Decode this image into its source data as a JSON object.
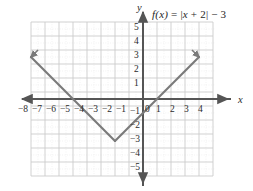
{
  "figure": {
    "width": 253,
    "height": 191,
    "background": "#ffffff"
  },
  "function_label": {
    "full": "f(x) = |x + 2| − 3",
    "fname": "f",
    "fvar": "(x)",
    "equals": " = |",
    "expr_var": "x",
    "expr_rest": " + 2| − 3"
  },
  "axes": {
    "x_label": "x",
    "y_label": "y",
    "origin_label": "0",
    "x_ticks": [
      "−8",
      "−7",
      "−6",
      "−5",
      "−4",
      "−3",
      "−2",
      "−1",
      "1",
      "2",
      "3",
      "4"
    ],
    "y_ticks": [
      "5",
      "4",
      "3",
      "2",
      "1",
      "−1",
      "−2",
      "−3",
      "−4",
      "−5"
    ],
    "x_range": [
      -8.5,
      4.5
    ],
    "y_range": [
      -5.5,
      5.5
    ],
    "axis_color": "#555555",
    "grid_color": "#c9c9c9",
    "minor_grid_color": "#e2e2e2"
  },
  "chart_data": {
    "type": "line",
    "title": "",
    "subtitle": "",
    "xlabel": "x",
    "ylabel": "y",
    "xlim": [
      -8.5,
      4.5
    ],
    "ylim": [
      -5.5,
      5.5
    ],
    "grid": true,
    "legend": "none",
    "annotations": [
      "f(x) = |x + 2| − 3"
    ],
    "series": [
      {
        "name": "f(x) = |x + 2| − 3",
        "color": "#7a7a7a",
        "arrow_start": true,
        "arrow_end": true,
        "vertex": [
          -2,
          -3
        ],
        "x": [
          -8,
          -2,
          4
        ],
        "values": [
          3,
          -3,
          3
        ]
      }
    ],
    "x_ticks": [
      -8,
      -7,
      -6,
      -5,
      -4,
      -3,
      -2,
      -1,
      1,
      2,
      3,
      4
    ],
    "y_ticks": [
      5,
      4,
      3,
      2,
      1,
      -1,
      -2,
      -3,
      -4,
      -5
    ],
    "x_intercepts": [
      -5,
      1
    ],
    "y_intercept": -1
  },
  "tick_positions": {
    "x": [
      {
        "label": "−8",
        "left": 18,
        "top": 105
      },
      {
        "label": "−7",
        "left": 32,
        "top": 105
      },
      {
        "label": "−6",
        "left": 46,
        "top": 105
      },
      {
        "label": "−5",
        "left": 60,
        "top": 105
      },
      {
        "label": "−4",
        "left": 74,
        "top": 105
      },
      {
        "label": "−3",
        "left": 88,
        "top": 105
      },
      {
        "label": "−2",
        "left": 102,
        "top": 105
      },
      {
        "label": "−1",
        "left": 116,
        "top": 105
      },
      {
        "label": "1",
        "left": 156,
        "top": 105
      },
      {
        "label": "2",
        "left": 170,
        "top": 105
      },
      {
        "label": "3",
        "left": 184,
        "top": 105
      },
      {
        "label": "4",
        "left": 198,
        "top": 105
      }
    ],
    "y": [
      {
        "label": "5",
        "left": 134,
        "top": 23
      },
      {
        "label": "4",
        "left": 134,
        "top": 37
      },
      {
        "label": "3",
        "left": 134,
        "top": 51
      },
      {
        "label": "2",
        "left": 134,
        "top": 65
      },
      {
        "label": "1",
        "left": 134,
        "top": 79
      },
      {
        "label": "−1",
        "left": 130,
        "top": 107
      },
      {
        "label": "−2",
        "left": 130,
        "top": 121
      },
      {
        "label": "−3",
        "left": 130,
        "top": 135
      },
      {
        "label": "−4",
        "left": 130,
        "top": 149
      },
      {
        "label": "−5",
        "left": 130,
        "top": 163
      }
    ],
    "origin": {
      "label": "0",
      "left": 145,
      "top": 105
    }
  }
}
